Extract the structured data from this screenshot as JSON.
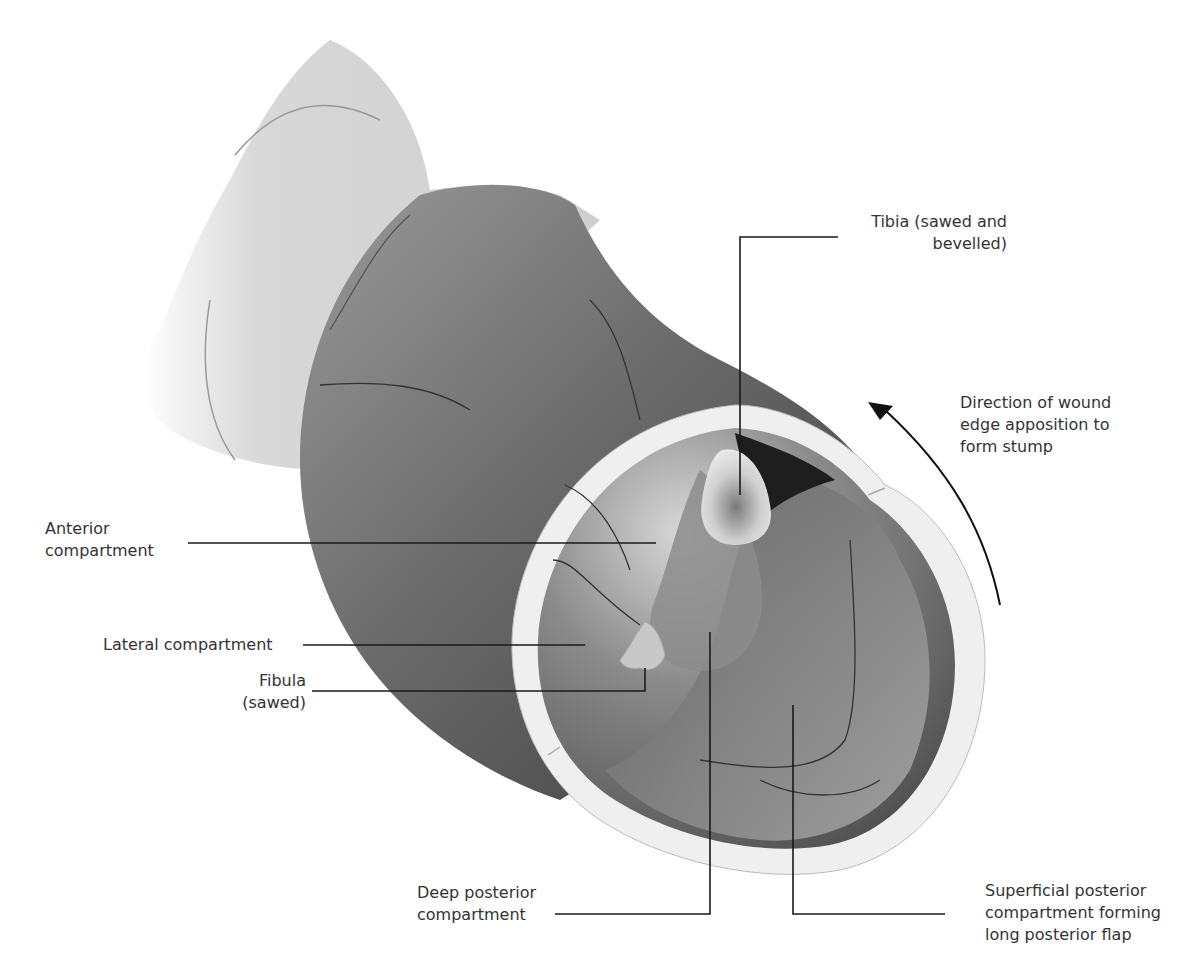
{
  "figure": {
    "colors": {
      "background": "#ffffff",
      "thigh_light": "#d6d6d6",
      "leg_dark": "#5a5a5a",
      "skin_rim": "#eeeeee",
      "flap_rim": "#dadada",
      "leader_line": "#1a1a1a",
      "text": "#333333"
    },
    "labels": {
      "tibia": "Tibia  (sawed and\nbevelled)",
      "direction": "Direction of wound\nedge apposition to\nform stump",
      "anterior": "Anterior\ncompartment",
      "lateral": "Lateral compartment",
      "fibula": "Fibula\n(sawed)",
      "deep_posterior": "Deep posterior\ncompartment",
      "superficial_posterior": "Superficial posterior\ncompartment forming\nlong posterior flap"
    },
    "arrow": {
      "icon": "curved-arrow-icon",
      "direction": "counter-clockwise, pointing up-left"
    }
  }
}
